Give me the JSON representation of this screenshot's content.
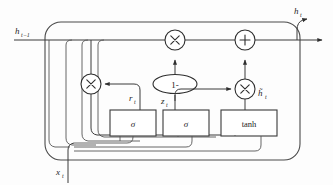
{
  "figure": {
    "type": "diagram",
    "background_color": "#fdfdfd",
    "line_color": "#3b3b3b"
  },
  "labels": {
    "input_state": "h",
    "input_state_sub": "t−1",
    "output_state": "h",
    "output_state_sub": "t",
    "input_x": "x",
    "input_x_sub": "t",
    "reset_gate": "r",
    "reset_gate_sub": "t",
    "update_gate": "z",
    "update_gate_sub": "t",
    "candidate_state": "h̃",
    "candidate_state_sub": "t"
  },
  "nodes": {
    "multiply_left": "×",
    "multiply_top": "×",
    "multiply_right": "×",
    "add": "+",
    "one_minus": "1-",
    "sigmoid_reset": "σ",
    "sigmoid_update": "σ",
    "tanh": "tanh"
  }
}
